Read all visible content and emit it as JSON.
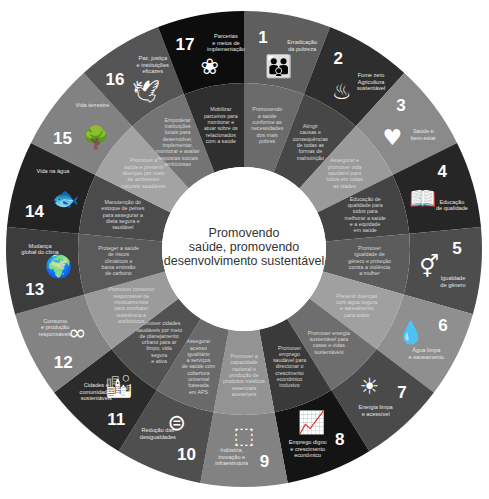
{
  "center": {
    "lines": [
      "Promovendo",
      "saúde, promovendo",
      "desenvolvimento sustentável"
    ]
  },
  "geometry": {
    "cx": 244,
    "cy": 249,
    "r_outer": 238,
    "r_mid": 166,
    "r_inner": 82
  },
  "goals": [
    {
      "number": "1",
      "title": [
        "Erradicação",
        "da pobreza"
      ],
      "icon": "family-icon",
      "glyph": "👪",
      "outer_color": "#5e5e5e",
      "inner_color": "#6b6b6b",
      "inner_text": [
        "Promovendo",
        "a saúde",
        "conforme as",
        "necessidades",
        "dos mais",
        "pobres"
      ]
    },
    {
      "number": "2",
      "title": [
        "Fome zero",
        "Agricultura",
        "sustentável"
      ],
      "icon": "bowl-icon",
      "glyph": "♨",
      "outer_color": "#2e2e2e",
      "inner_color": "#474747",
      "inner_text": [
        "Atingir",
        "causas e",
        "consequências",
        "de todas as",
        "formas de",
        "malnutrição"
      ]
    },
    {
      "number": "3",
      "title": [
        "Saúde e",
        "bem-estar"
      ],
      "icon": "heartbeat-icon",
      "glyph": "♥",
      "outer_color": "#8a8a8a",
      "inner_color": "#9a9a9a",
      "inner_text": [
        "Assegurar e",
        "promover vida",
        "saudável para",
        "todos em todas",
        "as idades"
      ]
    },
    {
      "number": "4",
      "title": [
        "Educação",
        "de qualidade"
      ],
      "icon": "book-icon",
      "glyph": "📖",
      "outer_color": "#262626",
      "inner_color": "#444444",
      "inner_text": [
        "Educação de",
        "qualidade para",
        "todos para",
        "melhorar a saúde",
        "e a equidade",
        "em saúde"
      ]
    },
    {
      "number": "5",
      "title": [
        "Igualdade",
        "de gênero"
      ],
      "icon": "gender-equality-icon",
      "glyph": "⚥",
      "outer_color": "#4d4d4d",
      "inner_color": "#5c5c5c",
      "inner_text": [
        "Promover",
        "igualdade de",
        "gênero e proteção",
        "contra a violência",
        "a mulher"
      ]
    },
    {
      "number": "6",
      "title": [
        "Água limpa",
        "e saneamento"
      ],
      "icon": "water-drop-icon",
      "glyph": "💧",
      "outer_color": "#8f8f8f",
      "inner_color": "#a0a0a0",
      "inner_text": [
        "Prevenir doenças",
        "com água segura",
        "e saneamento",
        "para todos"
      ]
    },
    {
      "number": "7",
      "title": [
        "Energia limpa",
        "e acessível"
      ],
      "icon": "sun-power-icon",
      "glyph": "☀",
      "outer_color": "#4a4a4a",
      "inner_color": "#6e6e6e",
      "inner_text": [
        "Promover energia",
        "sustentável para",
        "casas e vidas",
        "sustentáveis"
      ]
    },
    {
      "number": "8",
      "title": [
        "Emprego digno",
        "e crescimento",
        "econômico"
      ],
      "icon": "growth-chart-icon",
      "glyph": "📈",
      "outer_color": "#141414",
      "inner_color": "#3a3a3a",
      "inner_text": [
        "Promover",
        "emprego",
        "saudável para",
        "direcionar o",
        "crescimento",
        "econômico",
        "inclusivo"
      ]
    },
    {
      "number": "9",
      "title": [
        "Indústria,",
        "inovação e",
        "infraestrutura"
      ],
      "icon": "cubes-icon",
      "glyph": "⬚",
      "outer_color": "#828282",
      "inner_color": "#939393",
      "inner_text": [
        "Promover a",
        "capacidade",
        "nacional e",
        "produção de",
        "produtos médicos",
        "essenciais",
        "acessíveis"
      ]
    },
    {
      "number": "10",
      "title": [
        "Redução das",
        "desigualdades"
      ],
      "icon": "equality-circle-icon",
      "glyph": "⊜",
      "outer_color": "#4f4f4f",
      "inner_color": "#6a6a6a",
      "inner_text": [
        "Assegurar",
        "acesso",
        "igualitário",
        "a serviços",
        "de saúde com",
        "cobertura",
        "universal",
        "baseada",
        "em APS"
      ]
    },
    {
      "number": "11",
      "title": [
        "Cidades e",
        "comunidades",
        "sustentáveis"
      ],
      "icon": "city-buildings-icon",
      "glyph": "🏙",
      "outer_color": "#2b2b2b",
      "inner_color": "#525252",
      "inner_text": [
        "Promover cidades",
        "saudáveis por meio",
        "de planejamento",
        "urbano para ar",
        "limpo, vida",
        "segura",
        "e ativa"
      ]
    },
    {
      "number": "12",
      "title": [
        "Consumo",
        "e produção",
        "responsáveis"
      ],
      "icon": "infinity-icon",
      "glyph": "∞",
      "outer_color": "#838383",
      "inner_color": "#9b9b9b",
      "inner_text": [
        "Promover consumo",
        "responsável de",
        "medicamentos",
        "para combater",
        "resistência a",
        "antibióticos"
      ]
    },
    {
      "number": "13",
      "title": [
        "Mudança",
        "global do clima"
      ],
      "icon": "earth-eye-icon",
      "glyph": "🌍",
      "outer_color": "#3c3c3c",
      "inner_color": "#5a5a5a",
      "inner_text": [
        "Proteger a saúde",
        "de riscos",
        "climáticos e",
        "baixa emissão",
        "de carbono"
      ]
    },
    {
      "number": "14",
      "title": [
        "Vida na água"
      ],
      "icon": "fish-icon",
      "glyph": "🐟",
      "outer_color": "#232323",
      "inner_color": "#4b4b4b",
      "inner_text": [
        "Manutenção do",
        "estoque de peixes",
        "para assegurar a",
        "dieta segura e",
        "saudável"
      ]
    },
    {
      "number": "15",
      "title": [
        "Vida terrestre"
      ],
      "icon": "tree-icon",
      "glyph": "🌳",
      "outer_color": "#828282",
      "inner_color": "#a3a3a3",
      "inner_text": [
        "Promover a",
        "saúde e prevenir",
        "doenças por meio",
        "de ambientes",
        "naturais saudáveis"
      ]
    },
    {
      "number": "16",
      "title": [
        "Paz, justiça",
        "e instituições",
        "eficazes"
      ],
      "icon": "dove-icon",
      "glyph": "🕊",
      "outer_color": "#555555",
      "inner_color": "#747474",
      "inner_text": [
        "Empoderar",
        "instituições",
        "locais para",
        "desenvolver,",
        "implementar,",
        "monitorar e avaliar",
        "respostas sociais",
        "ambiciosas"
      ]
    },
    {
      "number": "17",
      "title": [
        "Parcerias",
        "e meios de",
        "implementação"
      ],
      "icon": "partnership-rings-icon",
      "glyph": "❀",
      "outer_color": "#0d0d0d",
      "inner_color": "#2f2f2f",
      "inner_text": [
        "Mobilizar",
        "parceiros para",
        "monitorar e",
        "atuar sobre os",
        "relacionados",
        "com a saúde"
      ]
    }
  ]
}
